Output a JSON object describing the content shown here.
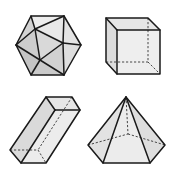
{
  "figure": {
    "colors": {
      "face_light": "#ededed",
      "face_mid": "#d9d9d9",
      "face_dark": "#c4c4c4",
      "edge": "#1a1a1a",
      "background": "#ffffff"
    },
    "shapes": [
      {
        "name": "icosahedron",
        "position": "top-left"
      },
      {
        "name": "cube",
        "position": "top-right"
      },
      {
        "name": "rectangular-prism",
        "position": "bottom-left"
      },
      {
        "name": "pentagonal-pyramid",
        "position": "bottom-right"
      }
    ]
  }
}
